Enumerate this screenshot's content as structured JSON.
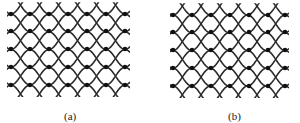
{
  "figure": {
    "panels": [
      {
        "label": "(a)",
        "label_x": 64,
        "label_y": 110,
        "x0": 8,
        "x1": 128,
        "dot_xs": [
          11,
          30,
          49,
          68,
          87,
          106,
          125
        ],
        "row_ys": [
          14,
          31,
          49,
          67,
          85
        ],
        "pattern": "regular-eyes"
      },
      {
        "label": "(b)",
        "label_x": 228,
        "label_y": 110,
        "x0": 171,
        "x1": 287,
        "dot_xs": [
          173,
          192,
          211,
          230,
          249,
          268,
          285
        ],
        "row_ys": [
          15,
          32,
          50,
          68,
          86
        ],
        "pattern": "alternating-eyes"
      }
    ],
    "colors": {
      "line": "#2a2a2a",
      "dot": "#111111",
      "background": "#ffffff"
    }
  }
}
